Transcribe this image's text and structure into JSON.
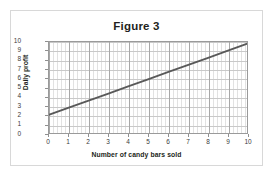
{
  "figure": {
    "title": "Figure 3",
    "border_color": "#d8d8d8",
    "background": "#ffffff"
  },
  "chart_data": {
    "type": "line",
    "title": "Figure 3",
    "xlabel": "Number of candy bars sold",
    "ylabel": "Daily profit",
    "xlim": [
      0,
      10
    ],
    "ylim": [
      0,
      10
    ],
    "xticks": [
      "0",
      "1",
      "2",
      "3",
      "4",
      "5",
      "6",
      "7",
      "8",
      "9",
      "10"
    ],
    "yticks": [
      "0",
      "1",
      "2",
      "3",
      "4",
      "5",
      "6",
      "7",
      "8",
      "9",
      "10"
    ],
    "grid": true,
    "grid_minor_x": true,
    "legend": "none",
    "line_color": "#595959",
    "series": [
      {
        "name": "Daily profit",
        "x": [
          0,
          1,
          2,
          3,
          4,
          5,
          6,
          7,
          8,
          9,
          10
        ],
        "values": [
          2.0,
          2.78,
          3.56,
          4.34,
          5.12,
          5.9,
          6.68,
          7.46,
          8.24,
          9.02,
          9.8
        ],
        "intercept": 2.0,
        "slope": 0.78
      }
    ]
  }
}
